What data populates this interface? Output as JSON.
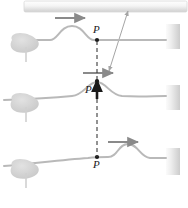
{
  "figure": {
    "colors": {
      "string": "#b9b9b9",
      "wall_light": "#f2f2f2",
      "wall_dark": "#c9c9c9",
      "hand": "#d6d6d6",
      "arrow_gray": "#8a8a8a",
      "arrow_dark": "#1a1a1a",
      "dot": "#1a1a1a",
      "dashed": "#3a3a3a",
      "ceiling_light": "#fbfbfb",
      "ceiling_dark": "#d3d3d3",
      "leader": "#9a9a9a"
    },
    "ceiling": {
      "name": "ceiling-bar",
      "x": 24,
      "y": 1,
      "width": 163,
      "height": 11
    },
    "leader": {
      "name": "leader-line",
      "from_x": 128,
      "from_y": 11,
      "to_x": 108,
      "to_y": 72,
      "head_top": true,
      "head_bottom": true
    },
    "panels": [
      {
        "id": "panel-top",
        "label": "P",
        "label_x": 94,
        "label_y": 25,
        "dot_x": 97,
        "dot_y": 40,
        "baseline_y": 40,
        "wall": {
          "x": 166,
          "y": 24,
          "width": 14,
          "height": 25
        },
        "velocity_arrow": {
          "x1": 55,
          "y1": 18,
          "x2": 87,
          "y2": 18,
          "color": "arrow_gray"
        },
        "pulse_peak_x": 72,
        "pulse_amplitude": 14,
        "hand_x": 14,
        "hand_y": 40
      },
      {
        "id": "panel-middle",
        "label": "P",
        "label_x": 88,
        "label_y": 89,
        "dot_x": 97,
        "dot_y": 81,
        "baseline_y": 95,
        "wall": {
          "x": 166,
          "y": 85,
          "width": 14,
          "height": 25
        },
        "velocity_arrow": {
          "x1": 83,
          "y1": 73,
          "x2": 115,
          "y2": 73,
          "color": "arrow_gray"
        },
        "transverse_arrow": {
          "x1": 97,
          "y1": 98,
          "x2": 97,
          "y2": 79,
          "color": "arrow_dark"
        },
        "pulse_peak_x": 97,
        "pulse_amplitude": 14,
        "hand_x": 14,
        "hand_y": 95
      },
      {
        "id": "panel-bottom",
        "label": "P",
        "label_x": 94,
        "label_y": 163,
        "dot_x": 97,
        "dot_y": 157,
        "baseline_y": 157,
        "wall": {
          "x": 166,
          "y": 148,
          "width": 14,
          "height": 27
        },
        "velocity_arrow": {
          "x1": 108,
          "y1": 142,
          "x2": 140,
          "y2": 142,
          "color": "arrow_gray"
        },
        "pulse_peak_x": 122,
        "pulse_amplitude": 14,
        "hand_x": 14,
        "hand_y": 157
      }
    ],
    "dashed_line": {
      "name": "vertical-dashed-reference",
      "x": 97,
      "y_top": 40,
      "y_bottom": 160,
      "dash": "4 3"
    }
  }
}
